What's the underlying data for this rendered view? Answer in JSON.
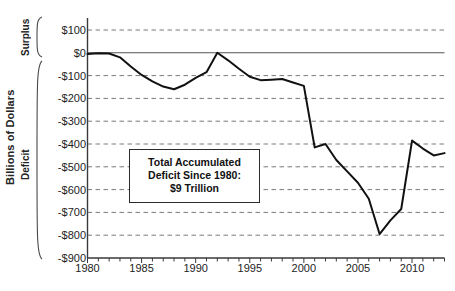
{
  "chart_data": {
    "type": "line",
    "title": "",
    "xlabel": "",
    "ylabel": "Billions of Dollars",
    "xlim": [
      1980,
      2013
    ],
    "ylim": [
      -900,
      150
    ],
    "grid": true,
    "legend": "none",
    "y_tick_labels": [
      "$100",
      "$0",
      "-$100",
      "-$200",
      "-$300",
      "-$400",
      "-$500",
      "-$600",
      "-$700",
      "-$800",
      "-$900"
    ],
    "y_tick_values": [
      100,
      0,
      -100,
      -200,
      -300,
      -400,
      -500,
      -600,
      -700,
      -800,
      -900
    ],
    "x_tick_labels": [
      "1980",
      "1985",
      "1990",
      "1995",
      "2000",
      "2005",
      "2010"
    ],
    "x_tick_values": [
      1980,
      1985,
      1990,
      1995,
      2000,
      2005,
      2010
    ],
    "x_minor_step": 1,
    "region_labels": {
      "above_zero": "Surplus",
      "below_zero": "Deficit"
    },
    "series": [
      {
        "name": "Federal Budget Surplus/Deficit",
        "color": "#111111",
        "x": [
          1980,
          1981,
          1982,
          1983,
          1984,
          1985,
          1986,
          1987,
          1988,
          1989,
          1990,
          1991,
          1992,
          1993,
          1994,
          1995,
          1996,
          1997,
          1998,
          1999,
          2000,
          2001,
          2002,
          2003,
          2004,
          2005,
          2006,
          2007,
          2008,
          2009,
          2010,
          2011,
          2012,
          2013
        ],
        "values": [
          -5,
          -2,
          -3,
          -20,
          -60,
          -97,
          -125,
          -148,
          -160,
          -140,
          -110,
          -85,
          0,
          -33,
          -70,
          -105,
          -120,
          -118,
          -115,
          -130,
          -145,
          -415,
          -400,
          -470,
          -520,
          -570,
          -640,
          -795,
          -735,
          -685,
          -385,
          -420,
          -450,
          -440
        ]
      }
    ],
    "annotations": [
      {
        "name": "total-accumulated-deficit-callout",
        "lines": [
          "Total Accumulated",
          "Deficit Since 1980:",
          "$9 Trillion"
        ]
      }
    ],
    "colors": {
      "line": "#111111",
      "gridline": "#7a7a7a",
      "zero_line": "#555555",
      "axis": "#3a3a3a",
      "text": "#232323",
      "background": "#ffffff"
    }
  }
}
